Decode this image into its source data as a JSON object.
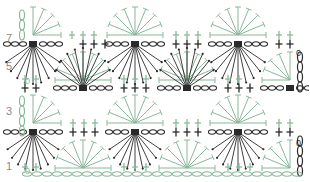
{
  "diagram": {
    "type": "crochet-chart",
    "row_labels": [
      {
        "label": "7",
        "x": 6,
        "y": 38
      },
      {
        "label": "5",
        "x": 6,
        "y": 66
      },
      {
        "label": "3",
        "x": 6,
        "y": 111
      },
      {
        "label": "1",
        "x": 6,
        "y": 166
      }
    ],
    "end_markers": [
      {
        "label": "0",
        "x": 296,
        "y": 56
      },
      {
        "label": "0",
        "x": 296,
        "y": 146
      },
      {
        "label": "0",
        "x": 25,
        "y": 84
      },
      {
        "label": "0",
        "x": 25,
        "y": 174
      }
    ],
    "colors": {
      "dark": "#2a2a2a",
      "green": "#8ab89a",
      "label": "#8a8a8a"
    },
    "dark_rows": [
      {
        "y": 44,
        "centers": [
          33,
          135,
          238
        ],
        "crosses_x": [
          83,
          94,
          105,
          176,
          187,
          198,
          279,
          290
        ]
      },
      {
        "y": 88,
        "centers": [
          83,
          187,
          290
        ],
        "crosses_x": [
          25,
          36,
          124,
          135,
          146,
          228,
          239,
          250
        ]
      },
      {
        "y": 132,
        "centers": [
          33,
          135,
          238
        ],
        "crosses_x": [
          73,
          84,
          95,
          176,
          187,
          198,
          279,
          290
        ]
      }
    ],
    "dark_fans": [
      {
        "cx": 33,
        "cy": 44,
        "dir": "down",
        "len": 40
      },
      {
        "cx": 135,
        "cy": 44,
        "dir": "down",
        "len": 40
      },
      {
        "cx": 238,
        "cy": 44,
        "dir": "down",
        "len": 40
      },
      {
        "cx": 83,
        "cy": 88,
        "dir": "up",
        "len": 40
      },
      {
        "cx": 187,
        "cy": 88,
        "dir": "up",
        "len": 40
      },
      {
        "cx": 33,
        "cy": 132,
        "dir": "down",
        "len": 38
      },
      {
        "cx": 135,
        "cy": 132,
        "dir": "down",
        "len": 38
      },
      {
        "cx": 238,
        "cy": 132,
        "dir": "down",
        "len": 38
      }
    ],
    "green_fans": [
      {
        "cx": 135,
        "cy": 35,
        "r": 28
      },
      {
        "cx": 238,
        "cy": 35,
        "r": 28
      },
      {
        "cx": 33,
        "cy": 35,
        "r": 28,
        "half": "right"
      },
      {
        "cx": 83,
        "cy": 80,
        "r": 28
      },
      {
        "cx": 187,
        "cy": 80,
        "r": 28
      },
      {
        "cx": 290,
        "cy": 80,
        "r": 28,
        "half": "left"
      },
      {
        "cx": 135,
        "cy": 123,
        "r": 28
      },
      {
        "cx": 238,
        "cy": 123,
        "r": 28
      },
      {
        "cx": 33,
        "cy": 123,
        "r": 28,
        "half": "right"
      },
      {
        "cx": 83,
        "cy": 168,
        "r": 28
      },
      {
        "cx": 187,
        "cy": 168,
        "r": 28
      },
      {
        "cx": 290,
        "cy": 168,
        "r": 28,
        "half": "left"
      }
    ],
    "green_crosses": [
      {
        "y": 35,
        "xs": [
          72,
          83,
          94,
          176,
          187,
          198,
          279,
          290
        ]
      },
      {
        "y": 79,
        "xs": [
          25,
          36,
          124,
          135,
          146,
          228,
          239
        ]
      },
      {
        "y": 123,
        "xs": [
          73,
          84,
          95,
          176,
          187,
          198,
          279,
          290
        ]
      },
      {
        "y": 167,
        "xs": [
          25,
          36,
          124,
          135,
          146,
          228,
          239,
          250
        ]
      }
    ],
    "foundation_chain": {
      "y": 174,
      "x_start": 22,
      "x_end": 302,
      "count": 28
    }
  }
}
